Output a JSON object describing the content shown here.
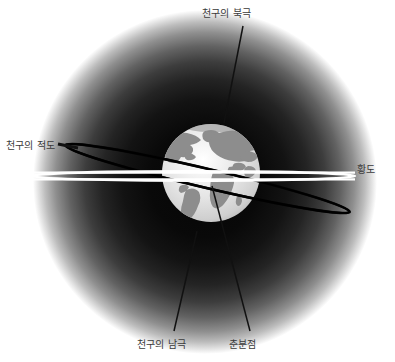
{
  "figure": {
    "title_alt": "천구의 적도와 황도 개념도",
    "width": 395,
    "height": 362,
    "background_color": "#ffffff"
  },
  "labels": {
    "north_celestial_pole": "천구의 북극",
    "celestial_equator": "천구의 적도",
    "ecliptic": "황도",
    "south_celestial_pole": "천구의 남극",
    "vernal_equinox": "춘분점"
  },
  "colors": {
    "label_text": "#3a3a3a",
    "sky_glow_core": "#0b0b0b",
    "sky_glow_edge": "#ffffff",
    "globe_ocean": "#d9d9d9",
    "globe_land": "#8d8d8d",
    "celestial_equator_line": "#000000",
    "ecliptic_line": "#ffffff",
    "leader_line": "#111111"
  },
  "geometry": {
    "globe": {
      "cx": 211,
      "cy": 173,
      "r": 49
    },
    "sky_glow": {
      "cx": 205,
      "cy": 182,
      "r": 172
    },
    "celestial_equator": {
      "left_x": 62,
      "left_y": 145,
      "right_x": 353,
      "right_y": 212
    },
    "ecliptic": {
      "left_x": 30,
      "left_y": 176,
      "right_x": 352,
      "right_y": 176
    }
  },
  "leaders": [
    {
      "name": "north-celestial-pole-leader",
      "x1": 243,
      "y1": 26,
      "x2": 224,
      "y2": 123
    },
    {
      "name": "celestial-equator-leader",
      "x1": 62,
      "y1": 145,
      "x2": 70,
      "y2": 146
    },
    {
      "name": "south-celestial-pole-leader",
      "x1": 197,
      "y1": 231,
      "x2": 174,
      "y2": 331
    },
    {
      "name": "vernal-equinox-leader",
      "x1": 212,
      "y1": 186,
      "x2": 250,
      "y2": 331
    }
  ]
}
